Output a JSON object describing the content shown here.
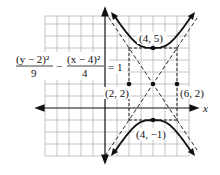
{
  "equation": {
    "num1": "(y − 2)²",
    "den1": "9",
    "minus": "−",
    "num2": "(x − 4)²",
    "den2": "4",
    "equals": "= 1"
  },
  "axes": {
    "x_label": "x",
    "y_label": "y"
  },
  "points": [
    {
      "label": "(4, 5)",
      "x": 4,
      "y": 5
    },
    {
      "label": "(4, −1)",
      "x": 4,
      "y": -1
    },
    {
      "label": "(2, 2)",
      "x": 2,
      "y": 2
    },
    {
      "label": "(6, 2)",
      "x": 6,
      "y": 2
    },
    {
      "label": "",
      "x": 4,
      "y": 2
    }
  ],
  "colors": {
    "curve": "#111111",
    "grid": "#b8b8b8",
    "axis": "#111111"
  }
}
